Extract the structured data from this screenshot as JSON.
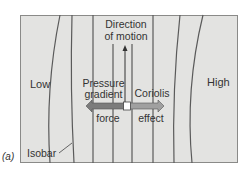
{
  "figure": {
    "panel_label": "(a)",
    "regions": {
      "low": "Low",
      "high": "High"
    },
    "motion_label_line1": "Direction",
    "motion_label_line2": "of motion",
    "pressure_label_line1": "Pressure",
    "pressure_label_line2": "gradient",
    "pressure_label_line3": "force",
    "coriolis_label_line1": "Coriolis",
    "coriolis_label_line2": "effect",
    "isobar_label": "Isobar",
    "colors": {
      "background": "#e3e3e1",
      "isobar_line": "#555555",
      "arrow_fill": "#8a8a8a",
      "arrow_dark": "#6e6e6e",
      "center_box": "#ffffff"
    }
  }
}
